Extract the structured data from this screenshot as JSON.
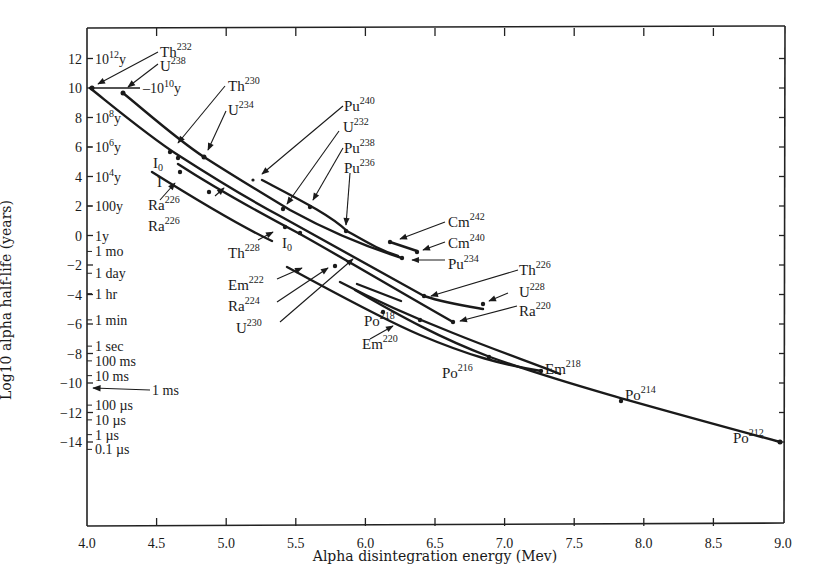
{
  "chart_data": {
    "type": "line",
    "title": "",
    "xlabel": "Alpha disintegration energy (Mev)",
    "ylabel": "Log10 alpha half-life (years)",
    "xlim": [
      4.0,
      9.0
    ],
    "ylim": [
      -19.5,
      14
    ],
    "grid": false,
    "x_ticks": [
      "4.0",
      "4.5",
      "5.0",
      "5.5",
      "6.0",
      "6.5",
      "7.0",
      "7.5",
      "8.0",
      "8.5",
      "9.0"
    ],
    "y_ticks": [
      "12",
      "10",
      "8",
      "6",
      "4",
      "2",
      "0",
      "-2",
      "-4",
      "-6",
      "-8",
      "-10",
      "-12",
      "-14"
    ],
    "time_scale_labels": [
      {
        "label": "10^12 y",
        "y": 12
      },
      {
        "label": "10^10 y",
        "y": 10
      },
      {
        "label": "10^8 y",
        "y": 8
      },
      {
        "label": "10^6 y",
        "y": 6
      },
      {
        "label": "10^4 y",
        "y": 4
      },
      {
        "label": "100y",
        "y": 2
      },
      {
        "label": "1y",
        "y": 0
      },
      {
        "label": "1 mo",
        "y": -1.08
      },
      {
        "label": "1 day",
        "y": -2.56
      },
      {
        "label": "1 hr",
        "y": -3.94
      },
      {
        "label": "1 min",
        "y": -5.72
      },
      {
        "label": "1 sec",
        "y": -7.5
      },
      {
        "label": "100 ms",
        "y": -8.5
      },
      {
        "label": "10 ms",
        "y": -9.5
      },
      {
        "label": "1 ms",
        "y": -10.5
      },
      {
        "label": "100 µs",
        "y": -11.5
      },
      {
        "label": "10 µs",
        "y": -12.5
      },
      {
        "label": "1 µs",
        "y": -13.5
      },
      {
        "label": "0.1 µs",
        "y": -14.5
      }
    ],
    "series": [
      {
        "name": "U238 series (even-even)",
        "points": [
          [
            4.2,
            9.65
          ],
          [
            4.77,
            5.4
          ],
          [
            5.33,
            1.8
          ],
          [
            5.8,
            -0.3
          ],
          [
            6.2,
            -1.6
          ]
        ]
      },
      {
        "name": "Th232 series (even-even)",
        "points": [
          [
            4.01,
            10.0
          ],
          [
            4.6,
            5.6
          ],
          [
            5.2,
            2.05
          ],
          [
            5.76,
            -0.65
          ],
          [
            6.3,
            -4.0
          ],
          [
            6.72,
            -4.8
          ]
        ]
      },
      {
        "name": "Ra/Th lower series",
        "points": [
          [
            4.66,
            4.0
          ],
          [
            5.3,
            0.4
          ],
          [
            5.6,
            -0.9
          ],
          [
            6.0,
            -2.8
          ],
          [
            6.6,
            -6.2
          ]
        ]
      },
      {
        "name": "Po/Em series",
        "points": [
          [
            5.6,
            -2.1
          ],
          [
            6.0,
            -4.5
          ],
          [
            6.4,
            -6.6
          ],
          [
            7.22,
            -9.3
          ]
        ]
      },
      {
        "name": "Po lower series",
        "points": [
          [
            4.66,
            4.0
          ],
          [
            5.4,
            -1.0
          ],
          [
            6.0,
            -4.5
          ],
          [
            6.8,
            -8.5
          ],
          [
            7.8,
            -11.7
          ],
          [
            8.95,
            -14.3
          ]
        ]
      },
      {
        "name": "Cm series",
        "points": [
          [
            6.22,
            -0.6
          ],
          [
            6.28,
            -1.2
          ]
        ]
      },
      {
        "name": "Pu240/Pu238 series",
        "points": [
          [
            5.17,
            3.8
          ],
          [
            5.5,
            1.9
          ],
          [
            5.77,
            0.2
          ],
          [
            6.05,
            -1.9
          ]
        ]
      }
    ],
    "annotations": [
      {
        "label": "Th232",
        "E": 4.01,
        "logT": 10.0
      },
      {
        "label": "U238",
        "E": 4.2,
        "logT": 9.65
      },
      {
        "label": "Th230",
        "E": 4.68,
        "logT": 5.9
      },
      {
        "label": "U234",
        "E": 4.77,
        "logT": 5.4
      },
      {
        "label": "I0",
        "E": 4.65,
        "logT": 5.0
      },
      {
        "label": "I",
        "E": 4.66,
        "logT": 4.0
      },
      {
        "label": "Ra226",
        "E": 4.78,
        "logT": 3.2
      },
      {
        "label": "Ra226",
        "E": 4.87,
        "logT": 2.8
      },
      {
        "label": "Pu240",
        "E": 5.17,
        "logT": 3.8
      },
      {
        "label": "U232",
        "E": 5.32,
        "logT": 1.6
      },
      {
        "label": "Pu238",
        "E": 5.49,
        "logT": 1.7
      },
      {
        "label": "Pu236",
        "E": 5.76,
        "logT": 0.25
      },
      {
        "label": "Th228",
        "E": 5.4,
        "logT": 0.6
      },
      {
        "label": "I0",
        "E": 5.48,
        "logT": 0.3
      },
      {
        "label": "Em222",
        "E": 5.48,
        "logT": -2.2
      },
      {
        "label": "Ra224",
        "E": 5.68,
        "logT": -1.9
      },
      {
        "label": "U230",
        "E": 5.88,
        "logT": -1.3
      },
      {
        "label": "Cm242",
        "E": 6.1,
        "logT": -0.6
      },
      {
        "label": "Cm240",
        "E": 6.26,
        "logT": -1.2
      },
      {
        "label": "Pu234",
        "E": 6.2,
        "logT": -1.7
      },
      {
        "label": "Th226",
        "E": 6.33,
        "logT": -4.1
      },
      {
        "label": "U228",
        "E": 6.8,
        "logT": -4.8
      },
      {
        "label": "Ra220",
        "E": 6.55,
        "logT": -6.0
      },
      {
        "label": "Po218",
        "E": 6.0,
        "logT": -5.4
      },
      {
        "label": "Em220",
        "E": 6.28,
        "logT": -5.9
      },
      {
        "label": "Po216",
        "E": 6.78,
        "logT": -8.5
      },
      {
        "label": "Em218",
        "E": 7.12,
        "logT": -9.3
      },
      {
        "label": "Po214",
        "E": 7.69,
        "logT": -11.6
      },
      {
        "label": "Po212",
        "E": 8.95,
        "logT": -14.3
      }
    ],
    "left_marker": {
      "label": "1 ms",
      "arrow_to": {
        "E": 4.0,
        "logT": -10.5
      }
    },
    "hline_marker": {
      "label": "10^10 y",
      "y": 10
    }
  }
}
